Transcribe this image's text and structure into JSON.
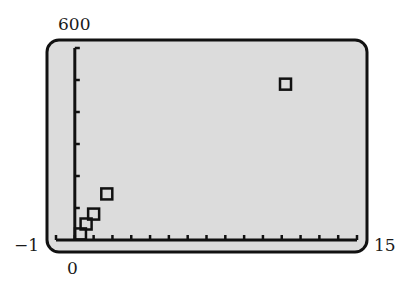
{
  "chart_data": {
    "type": "scatter",
    "title": "",
    "xlabel": "",
    "ylabel": "",
    "xlim": [
      -1,
      15
    ],
    "ylim": [
      0,
      600
    ],
    "x_tick_step": 1,
    "y_tick_step": 100,
    "grid": false,
    "legend": null,
    "marker": "square",
    "points": [
      {
        "x": 0.3,
        "y": 19
      },
      {
        "x": 0.6,
        "y": 50
      },
      {
        "x": 1.0,
        "y": 81
      },
      {
        "x": 1.7,
        "y": 144
      },
      {
        "x": 11.2,
        "y": 487
      }
    ],
    "window_labels": {
      "ymax": "600",
      "xmin": "−1",
      "xmax": "15",
      "ymin": "0"
    }
  },
  "colors": {
    "screen_bg": "#dcdcdc",
    "frame": "#111111",
    "axis": "#111111",
    "marker": "#111111"
  }
}
